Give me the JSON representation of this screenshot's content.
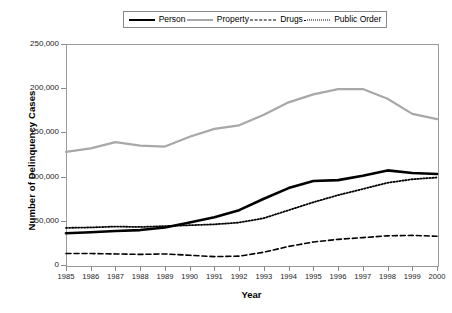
{
  "chart_data": {
    "type": "line",
    "title": "",
    "xlabel": "Year",
    "ylabel": "Number of Delinquency Cases",
    "x": [
      1985,
      1986,
      1987,
      1988,
      1989,
      1990,
      1991,
      1992,
      1993,
      1994,
      1995,
      1996,
      1997,
      1998,
      1999,
      2000
    ],
    "xtick_labels": [
      "1985",
      "1986",
      "1987",
      "1988",
      "1989",
      "1990",
      "1991",
      "1992",
      "1993",
      "1994",
      "1995",
      "1996",
      "1997",
      "1998",
      "1999",
      "2000"
    ],
    "ytick_labels": [
      "0",
      "50,000",
      "100,000",
      "150,000",
      "200,000",
      "250,000"
    ],
    "ytick_values": [
      0,
      50000,
      100000,
      150000,
      200000,
      250000
    ],
    "xlim": [
      1985,
      2000
    ],
    "ylim": [
      0,
      250000
    ],
    "grid": false,
    "legend_position": "top-center",
    "series": [
      {
        "name": "Person",
        "style": "solid",
        "color": "#000000",
        "width": 2.6,
        "values": [
          36000,
          37000,
          38500,
          39500,
          42500,
          48000,
          54000,
          62000,
          75000,
          87000,
          95000,
          96000,
          101000,
          107000,
          104000,
          103000
        ]
      },
      {
        "name": "Property",
        "style": "solid",
        "color": "#a8a8a8",
        "width": 2.2,
        "values": [
          128000,
          132000,
          139000,
          135000,
          134000,
          145000,
          154000,
          158000,
          170000,
          184000,
          193000,
          199000,
          199000,
          188000,
          171000,
          165000
        ]
      },
      {
        "name": "Drugs",
        "style": "dashed",
        "color": "#000000",
        "width": 1.6,
        "values": [
          13000,
          13000,
          12500,
          12000,
          12500,
          11000,
          9500,
          10000,
          14500,
          21000,
          26000,
          29000,
          31000,
          33000,
          33500,
          32500
        ]
      },
      {
        "name": "Public Order",
        "style": "dotted",
        "color": "#000000",
        "width": 1.8,
        "values": [
          42000,
          42500,
          43500,
          43000,
          44000,
          45000,
          46000,
          48000,
          53000,
          62000,
          71000,
          79000,
          86000,
          93000,
          97000,
          99000
        ]
      }
    ]
  },
  "legend": {
    "items": [
      {
        "label": "Person"
      },
      {
        "label": "Property"
      },
      {
        "label": "Drugs"
      },
      {
        "label": "Public Order"
      }
    ]
  }
}
